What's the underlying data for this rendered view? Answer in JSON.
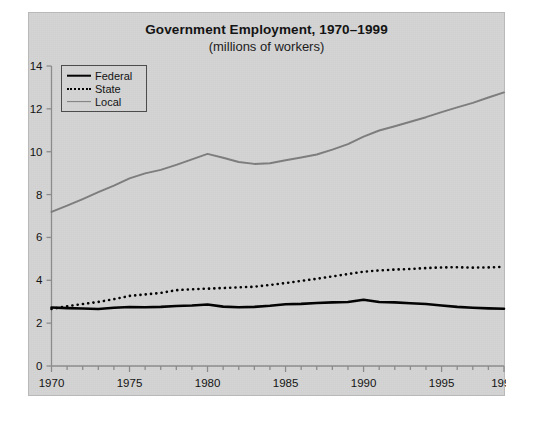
{
  "figure": {
    "title": "Government Employment, 1970–1999",
    "subtitle": "(millions of workers)"
  },
  "legend": {
    "items": [
      {
        "label": "Federal",
        "key": "line-solid-black-thick",
        "color": "#000000"
      },
      {
        "label": "State",
        "key": "line-dotted-black",
        "color": "#000000"
      },
      {
        "label": "Local",
        "key": "line-solid-gray",
        "color": "#7d7d7d"
      }
    ]
  },
  "axes": {
    "y_ticks": [
      "0",
      "2",
      "4",
      "6",
      "8",
      "10",
      "12",
      "14"
    ],
    "x_ticks": [
      "1970",
      "1975",
      "1980",
      "1985",
      "1990",
      "1995",
      "1999"
    ]
  },
  "chart_data": {
    "type": "line",
    "title": "Government Employment, 1970–1999",
    "subtitle": "(millions of workers)",
    "xlabel": "",
    "ylabel": "",
    "xlim": [
      1970,
      1999
    ],
    "ylim": [
      0,
      14
    ],
    "y_ticks": [
      0,
      2,
      4,
      6,
      8,
      10,
      12,
      14
    ],
    "x_ticks": [
      1970,
      1975,
      1980,
      1985,
      1990,
      1995,
      1999
    ],
    "x_minor_tick_interval": 1,
    "grid": false,
    "legend_position": "upper-left-inside",
    "x": [
      1970,
      1971,
      1972,
      1973,
      1974,
      1975,
      1976,
      1977,
      1978,
      1979,
      1980,
      1981,
      1982,
      1983,
      1984,
      1985,
      1986,
      1987,
      1988,
      1989,
      1990,
      1991,
      1992,
      1993,
      1994,
      1995,
      1996,
      1997,
      1998,
      1999
    ],
    "series": [
      {
        "name": "Federal",
        "style": "solid",
        "color": "#000000",
        "width": 2.6,
        "values": [
          2.73,
          2.7,
          2.68,
          2.66,
          2.72,
          2.75,
          2.74,
          2.76,
          2.8,
          2.82,
          2.87,
          2.77,
          2.74,
          2.76,
          2.81,
          2.88,
          2.9,
          2.94,
          2.97,
          2.99,
          3.09,
          2.99,
          2.97,
          2.93,
          2.89,
          2.82,
          2.76,
          2.72,
          2.69,
          2.67
        ]
      },
      {
        "name": "State",
        "style": "dotted",
        "color": "#000000",
        "width": 2.6,
        "values": [
          2.66,
          2.79,
          2.89,
          2.99,
          3.12,
          3.27,
          3.34,
          3.41,
          3.54,
          3.58,
          3.61,
          3.64,
          3.67,
          3.7,
          3.78,
          3.87,
          3.97,
          4.07,
          4.18,
          4.29,
          4.4,
          4.46,
          4.5,
          4.53,
          4.57,
          4.6,
          4.61,
          4.59,
          4.6,
          4.63
        ]
      },
      {
        "name": "Local",
        "style": "solid",
        "color": "#7d7d7d",
        "width": 1.9,
        "values": [
          7.19,
          7.48,
          7.79,
          8.11,
          8.42,
          8.76,
          8.99,
          9.15,
          9.39,
          9.64,
          9.9,
          9.72,
          9.52,
          9.43,
          9.46,
          9.6,
          9.73,
          9.87,
          10.1,
          10.35,
          10.7,
          10.99,
          11.19,
          11.4,
          11.61,
          11.85,
          12.07,
          12.28,
          12.53,
          12.77
        ]
      }
    ]
  }
}
